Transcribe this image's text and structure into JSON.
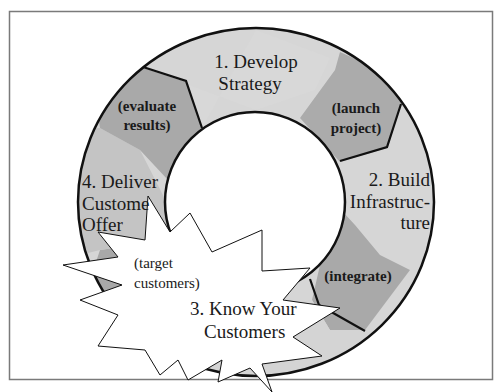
{
  "diagram": {
    "type": "cycle-ring",
    "colors": {
      "frame": "#7a7a7a",
      "ring_light": "#d6d6d6",
      "ring_mid": "#c6c6c6",
      "ring_dark": "#a9a9a9",
      "outline": "#111111",
      "starburst_fill": "#ffffff",
      "background": "#ffffff"
    },
    "phases": [
      {
        "number": "1.",
        "title_line1": "1. Develop",
        "title_line2": "Strategy"
      },
      {
        "number": "2.",
        "title_line1": "2. Build",
        "title_line2": "Infrastruc-",
        "title_line3": "ture"
      },
      {
        "number": "3.",
        "title_line1": "3. Know Your",
        "title_line2": "Customers"
      },
      {
        "number": "4.",
        "title_line1": "4. Deliver",
        "title_line2": "Customer",
        "title_line3": "Offer"
      }
    ],
    "transitions": [
      {
        "line1": "(launch",
        "line2": "project)"
      },
      {
        "line1": "(integrate)"
      },
      {
        "line1": "(target",
        "line2": "customers)"
      },
      {
        "line1": "(evaluate",
        "line2": "results)"
      }
    ],
    "visible_text": {
      "phase4_line2": "Custome",
      "phase4_line3": "Offer"
    }
  }
}
